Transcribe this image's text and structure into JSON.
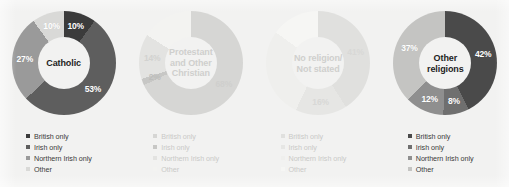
{
  "figure": {
    "background_color": "#f2f2f1",
    "panel_width": 509,
    "panel_height": 187
  },
  "legend_labels": {
    "british_only": "British only",
    "irish_only": "Irish only",
    "northern_irish_only": "Northern Irish only",
    "other": "Other"
  },
  "palette": {
    "british_only": "#3b3b3b",
    "irish_only": "#5e5e5e",
    "northern_irish_only": "#9a9a9a",
    "other": "#d9d9d7",
    "faded_british_only": "#d6d6d4",
    "faded_irish_only": "#dcdcda",
    "faded_northern_irish_only": "#e6e6e4",
    "faded_other": "#efefed"
  },
  "chart_data": [
    {
      "type": "pie",
      "title": "Catholic",
      "emphasis": "normal",
      "categories": [
        "British only",
        "Irish only",
        "Northern Irish only",
        "Other"
      ],
      "values": [
        10,
        53,
        27,
        10
      ],
      "labels": [
        "10%",
        "53%",
        "27%",
        "10%"
      ],
      "colors": [
        "#3b3b3b",
        "#5e5e5e",
        "#9a9a9a",
        "#d9d9d7"
      ],
      "label_colors": [
        "#ffffff",
        "#ffffff",
        "#ffffff",
        "#ffffff"
      ],
      "legend_position": "bottom-left",
      "grid": false
    },
    {
      "type": "pie",
      "title": "Protestant\nand Other\nChristian",
      "emphasis": "faded",
      "categories": [
        "British only",
        "Irish only",
        "Northern Irish only",
        "Other"
      ],
      "values": [
        68,
        2,
        14,
        16
      ],
      "labels": [
        "68%",
        "2%",
        "14%",
        ""
      ],
      "colors": [
        "#d6d6d4",
        "#c7c7c5",
        "#e3e3e1",
        "#f3f3f1"
      ],
      "label_colors": [
        "#cfcfcd",
        "#bdbdbb",
        "#d2d2d0",
        "#d2d2d0"
      ],
      "legend_position": "bottom-left",
      "grid": false
    },
    {
      "type": "pie",
      "title": "No religion/\nNot stated",
      "emphasis": "faded",
      "categories": [
        "British only",
        "Irish only",
        "Northern Irish only",
        "Other"
      ],
      "values": [
        41,
        16,
        28,
        15
      ],
      "labels": [
        "41%",
        "16%",
        "",
        ""
      ],
      "colors": [
        "#e0e0de",
        "#e6e6e4",
        "#efefed",
        "#f6f6f4"
      ],
      "label_colors": [
        "#d8d8d6",
        "#d8d8d6",
        "#d8d8d6",
        "#d8d8d6"
      ],
      "legend_position": "bottom-left",
      "grid": false
    },
    {
      "type": "pie",
      "title": "Other\nreligions",
      "emphasis": "normal",
      "categories": [
        "British only",
        "Irish only",
        "Northern Irish only",
        "Other"
      ],
      "values": [
        42,
        8,
        12,
        37
      ],
      "labels": [
        "42%",
        "8%",
        "12%",
        "37%"
      ],
      "colors": [
        "#4a4a4a",
        "#6f6f6f",
        "#8f8f8f",
        "#c4c4c2"
      ],
      "label_colors": [
        "#ffffff",
        "#ffffff",
        "#ffffff",
        "#ffffff"
      ],
      "legend_position": "bottom-left",
      "grid": false
    }
  ]
}
